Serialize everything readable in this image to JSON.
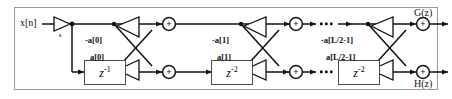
{
  "diagram": {
    "frame_border_color": "#9a9a9a",
    "line_color": "#111111",
    "box_border_color": "#4a4a4a",
    "background": "#ffffff"
  },
  "signals": {
    "input_label": "x[n]",
    "output_top_label": "G(z)",
    "output_bottom_label": "H(z)"
  },
  "gain": {
    "label": "s",
    "shape": "triangle-right"
  },
  "delays": [
    {
      "name": "delay-1",
      "base": "z",
      "exponent": "-1",
      "text": "z-1"
    },
    {
      "name": "delay-2",
      "base": "z",
      "exponent": "-2",
      "text": "z-2"
    },
    {
      "name": "delay-3",
      "base": "z",
      "exponent": "-2",
      "text": "z-2"
    }
  ],
  "stages": [
    {
      "index": 0,
      "coef_upper": "-a[0]",
      "coef_lower": "a[0]",
      "delay_text": "z-1",
      "adder_symbol": "+"
    },
    {
      "index": 1,
      "coef_upper": "-a[1]",
      "coef_lower": "a[1]",
      "delay_text": "z-2",
      "adder_symbol": "+"
    },
    {
      "index": 2,
      "coef_upper": "-a[L/2-1]",
      "coef_lower": "a[L/2-1]",
      "delay_text": "z-2",
      "adder_symbol": "+"
    }
  ],
  "adders": [
    {
      "name": "adder-top-1",
      "symbol": "+"
    },
    {
      "name": "adder-bottom-1",
      "symbol": "+"
    },
    {
      "name": "adder-top-2",
      "symbol": "+"
    },
    {
      "name": "adder-bottom-2",
      "symbol": "+"
    },
    {
      "name": "adder-top-3",
      "symbol": "+"
    },
    {
      "name": "adder-bottom-3",
      "symbol": "+"
    }
  ],
  "ellipses": [
    {
      "name": "ellipsis-top",
      "text": ""
    },
    {
      "name": "ellipsis-bottom",
      "text": ""
    }
  ]
}
